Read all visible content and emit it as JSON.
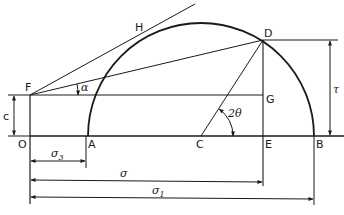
{
  "diagram": {
    "type": "mohr-circle-construction",
    "colors": {
      "ink": "#1a1a1a",
      "background": "#ffffff"
    },
    "points": {
      "O": {
        "label": "O",
        "x": 30,
        "y": 136
      },
      "A": {
        "label": "A",
        "x": 88,
        "y": 136
      },
      "C": {
        "label": "C",
        "x": 201,
        "y": 136
      },
      "E": {
        "label": "E",
        "x": 263,
        "y": 136
      },
      "B": {
        "label": "B",
        "x": 314,
        "y": 136
      },
      "D": {
        "label": "D",
        "x": 263,
        "y": 40
      },
      "F": {
        "label": "F",
        "x": 30,
        "y": 95
      },
      "G": {
        "label": "G",
        "x": 263,
        "y": 95
      },
      "H": {
        "label": "H",
        "x": 140,
        "y": 33
      }
    },
    "angles": {
      "alpha": "α",
      "two_theta": "2θ"
    },
    "dimensions": {
      "tau": "τ",
      "c": "c",
      "sigma3": {
        "symbol": "σ",
        "sub": "3"
      },
      "sigma": {
        "symbol": "σ"
      },
      "sigma1": {
        "symbol": "σ",
        "sub": "1"
      }
    }
  }
}
